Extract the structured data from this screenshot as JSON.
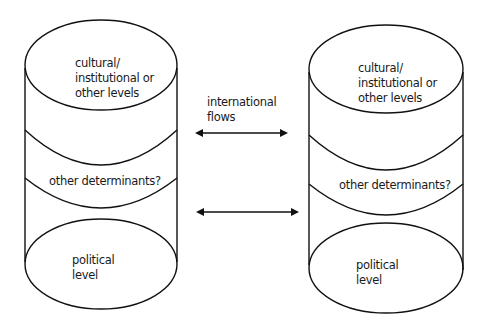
{
  "diagram": {
    "left_cylinder": {
      "top_label_lines": [
        "cultural/",
        "institutional or",
        "other levels"
      ],
      "middle_label": "other determinants?",
      "bottom_label_lines": [
        "political",
        "level"
      ]
    },
    "right_cylinder": {
      "top_label_lines": [
        "cultural/",
        "institutional or",
        "other levels"
      ],
      "middle_label": "other determinants?",
      "bottom_label_lines": [
        "political",
        "level"
      ]
    },
    "flows_label_lines": [
      "international",
      "flows"
    ],
    "arrows": [
      {
        "name": "upper-bidirectional-arrow",
        "direction": "both"
      },
      {
        "name": "lower-bidirectional-arrow",
        "direction": "both"
      }
    ],
    "colors": {
      "stroke": "#111111",
      "background": "#ffffff"
    }
  }
}
